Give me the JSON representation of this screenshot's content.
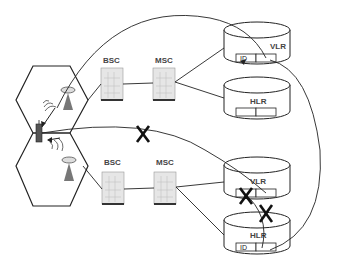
{
  "diagram": {
    "labels": {
      "bsc_top": "BSC",
      "msc_top": "MSC",
      "bsc_bottom": "BSC",
      "msc_bottom": "MSC",
      "db1": "VLR",
      "db2": "HLR",
      "db3": "VLR",
      "db4": "HLR",
      "db1_field": "ID",
      "db4_field": "ID",
      "cross_mark": "X"
    },
    "colors": {
      "line": "#222222",
      "equipment_fill": "#e6e6e6",
      "antenna": "#777777"
    }
  }
}
